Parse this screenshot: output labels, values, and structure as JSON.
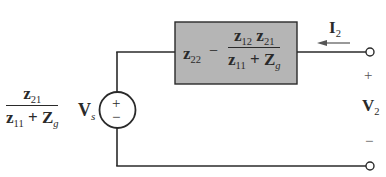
{
  "diagram": {
    "type": "circuit",
    "colors": {
      "wire": "#2a2a2a",
      "box_fill": "#b5b5b5",
      "box_border": "#2a2a2a",
      "background": "#ffffff"
    },
    "source": {
      "plus": "+",
      "minus": "−",
      "coefficient": {
        "numerator": {
          "base": "z",
          "sub": "21"
        },
        "denominator": [
          {
            "base": "z",
            "sub": "11"
          },
          {
            "op": "+"
          },
          {
            "base": "Z",
            "sub": "g"
          }
        ]
      },
      "voltage": {
        "base": "V",
        "sub": "s"
      }
    },
    "impedance_box": {
      "term1": {
        "base": "z",
        "sub": "22"
      },
      "op": "−",
      "fraction": {
        "numerator": [
          {
            "base": "z",
            "sub": "12"
          },
          {
            "base": "z",
            "sub": "21"
          }
        ],
        "denominator": [
          {
            "base": "z",
            "sub": "11"
          },
          {
            "op": "+"
          },
          {
            "base": "Z",
            "sub": "g"
          }
        ]
      }
    },
    "current": {
      "base": "I",
      "sub": "2",
      "direction": "left"
    },
    "output_voltage": {
      "base": "V",
      "sub": "2",
      "plus": "+",
      "minus": "−"
    }
  }
}
